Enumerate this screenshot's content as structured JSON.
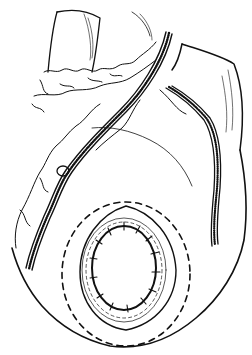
{
  "figure": {
    "type": "line-art illustration",
    "background": "#ffffff",
    "ink": "#111111"
  }
}
